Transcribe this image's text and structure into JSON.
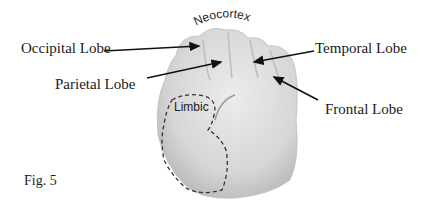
{
  "figure": {
    "caption": "Fig. 5",
    "title_label": "Neocortex",
    "region_label": "Limbic",
    "labels": [
      {
        "id": "occipital",
        "text": "Occipital Lobe"
      },
      {
        "id": "parietal",
        "text": "Parietal Lobe"
      },
      {
        "id": "temporal",
        "text": "Temporal Lobe"
      },
      {
        "id": "frontal",
        "text": "Frontal Lobe"
      }
    ],
    "colors": {
      "hand": "#d9d9d9",
      "text": "#1a1a1a",
      "arrow": "#111111"
    }
  }
}
